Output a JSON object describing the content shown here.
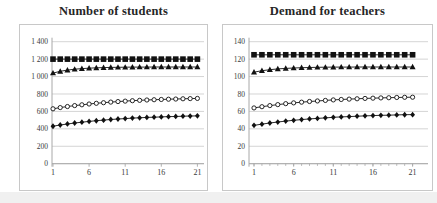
{
  "colors": {
    "series": "#111111",
    "marker_fill": "#111111",
    "open_marker_fill": "#ffffff",
    "grid": "#c9c9c9",
    "axis": "#a8a8a8",
    "border": "#c8c8c8",
    "title_text": "#262626",
    "background": "#ffffff"
  },
  "chart_data": [
    {
      "type": "line",
      "title": "Number of students",
      "xlabel": "",
      "ylabel": "",
      "legend": "none",
      "grid": true,
      "x": [
        1,
        2,
        3,
        4,
        5,
        6,
        7,
        8,
        9,
        10,
        11,
        12,
        13,
        14,
        15,
        16,
        17,
        18,
        19,
        20,
        21
      ],
      "xticks": [
        1,
        6,
        11,
        16,
        21
      ],
      "xtick_labels": [
        "1",
        "6",
        "11",
        "16",
        "21"
      ],
      "minor_xticks": false,
      "ylim": [
        0,
        1400
      ],
      "yticks": [
        {
          "value": 0,
          "label": "0"
        },
        {
          "value": 200,
          "label": "200"
        },
        {
          "value": 400,
          "label": "400"
        },
        {
          "value": 600,
          "label": "600"
        },
        {
          "value": 800,
          "label": "800"
        },
        {
          "value": 1000,
          "label": "1 000"
        },
        {
          "value": 1200,
          "label": "1 200"
        },
        {
          "value": 1400,
          "label": "1 400"
        }
      ],
      "series": [
        {
          "name": "capacity-squares",
          "marker": "square",
          "values": [
            1200,
            1200,
            1200,
            1200,
            1200,
            1200,
            1200,
            1200,
            1200,
            1200,
            1200,
            1200,
            1200,
            1200,
            1200,
            1200,
            1200,
            1200,
            1200,
            1200,
            1200
          ]
        },
        {
          "name": "upper-triangles",
          "marker": "triangle",
          "values": [
            1040,
            1060,
            1074,
            1084,
            1091,
            1096,
            1100,
            1103,
            1105,
            1106,
            1107,
            1108,
            1109,
            1109,
            1110,
            1110,
            1110,
            1110,
            1110,
            1110,
            1110
          ]
        },
        {
          "name": "middle-open-circles",
          "marker": "circle-open",
          "values": [
            630,
            644,
            656,
            667,
            676,
            685,
            693,
            700,
            707,
            713,
            718,
            723,
            727,
            731,
            734,
            737,
            740,
            742,
            745,
            747,
            749
          ]
        },
        {
          "name": "lower-diamonds",
          "marker": "diamond",
          "values": [
            430,
            444,
            456,
            467,
            476,
            485,
            493,
            500,
            507,
            513,
            518,
            523,
            527,
            531,
            534,
            537,
            540,
            542,
            545,
            547,
            549
          ]
        }
      ]
    },
    {
      "type": "line",
      "title": "Demand for teachers",
      "xlabel": "",
      "ylabel": "",
      "legend": "none",
      "grid": true,
      "x": [
        1,
        2,
        3,
        4,
        5,
        6,
        7,
        8,
        9,
        10,
        11,
        12,
        13,
        14,
        15,
        16,
        17,
        18,
        19,
        20,
        21
      ],
      "xticks": [
        1,
        6,
        11,
        16,
        21
      ],
      "xtick_labels": [
        "1",
        "6",
        "11",
        "16",
        "21"
      ],
      "minor_xticks": true,
      "ylim": [
        0,
        140
      ],
      "yticks": [
        {
          "value": 0,
          "label": "0"
        },
        {
          "value": 20,
          "label": "20"
        },
        {
          "value": 40,
          "label": "40"
        },
        {
          "value": 60,
          "label": "60"
        },
        {
          "value": 80,
          "label": "80"
        },
        {
          "value": 100,
          "label": "100"
        },
        {
          "value": 120,
          "label": "120"
        },
        {
          "value": 140,
          "label": "140"
        }
      ],
      "series": [
        {
          "name": "capacity-squares",
          "marker": "square",
          "values": [
            125,
            125,
            125,
            125,
            125,
            125,
            125,
            125,
            125,
            125,
            125,
            125,
            125,
            125,
            125,
            125,
            125,
            125,
            125,
            125,
            125
          ]
        },
        {
          "name": "upper-triangles",
          "marker": "triangle",
          "values": [
            105,
            106.7,
            107.9,
            108.8,
            109.4,
            109.8,
            110.2,
            110.4,
            110.6,
            110.7,
            110.8,
            110.9,
            110.9,
            111,
            111,
            111,
            111,
            111,
            111,
            111,
            111
          ]
        },
        {
          "name": "middle-open-circles",
          "marker": "circle-open",
          "values": [
            64,
            65.4,
            66.7,
            67.8,
            68.9,
            69.8,
            70.6,
            71.4,
            72,
            72.6,
            73.2,
            73.7,
            74.1,
            74.5,
            74.9,
            75.2,
            75.5,
            75.7,
            76,
            76.2,
            76.3
          ]
        },
        {
          "name": "lower-diamonds",
          "marker": "diamond",
          "values": [
            44,
            45.4,
            46.7,
            47.8,
            48.9,
            49.8,
            50.6,
            51.4,
            52,
            52.6,
            53.2,
            53.7,
            54.1,
            54.5,
            54.9,
            55.2,
            55.5,
            55.7,
            56,
            56.2,
            56.3
          ]
        }
      ]
    }
  ]
}
